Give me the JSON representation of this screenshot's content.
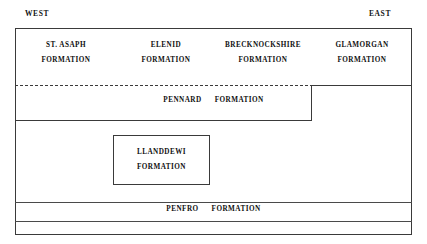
{
  "orientation": {
    "west_label": "WEST",
    "east_label": "EAST"
  },
  "chart_data": {
    "type": "diagram",
    "title": "",
    "subtype": "stratigraphic-correlation-chart",
    "axis_labels": {
      "left": "WEST",
      "right": "EAST"
    },
    "units": [
      {
        "name": "ST. ASAPH",
        "qualifier": "FORMATION",
        "row": "upper",
        "column": 1,
        "extent_west": 0.0,
        "extent_east": 0.25
      },
      {
        "name": "ELENID",
        "qualifier": "FORMATION",
        "row": "upper",
        "column": 2,
        "extent_west": 0.25,
        "extent_east": 0.5
      },
      {
        "name": "BRECKNOCKSHIRE",
        "qualifier": "FORMATION",
        "row": "upper",
        "column": 3,
        "extent_west": 0.5,
        "extent_east": 0.75
      },
      {
        "name": "GLAMORGAN",
        "qualifier": "FORMATION",
        "row": "upper",
        "column": 4,
        "extent_west": 0.75,
        "extent_east": 1.0
      },
      {
        "name": "PENNARD",
        "qualifier": "FORMATION",
        "row": "middle",
        "extent_west": 0.0,
        "extent_east": 0.75
      },
      {
        "name": "LLANDDEWI",
        "qualifier": "FORMATION",
        "row": "lower-inset",
        "extent_west": 0.25,
        "extent_east": 0.49
      },
      {
        "name": "PENFRO",
        "qualifier": "FORMATION",
        "row": "basal",
        "extent_west": 0.0,
        "extent_east": 1.0
      }
    ],
    "boundaries": [
      {
        "name": "pennard-upper-boundary-west",
        "style": "dashed",
        "extent_west": 0.0,
        "extent_east": 0.75
      },
      {
        "name": "pennard-upper-boundary-east",
        "style": "solid",
        "extent_west": 0.75,
        "extent_east": 1.0
      },
      {
        "name": "pennard-base",
        "style": "solid",
        "extent_west": 0.0,
        "extent_east": 0.75
      },
      {
        "name": "penfro-top",
        "style": "solid",
        "extent_west": 0.0,
        "extent_east": 1.0
      },
      {
        "name": "penfro-base",
        "style": "solid",
        "extent_west": 0.0,
        "extent_east": 1.0
      }
    ],
    "colors": {
      "line": "#3a3a3a",
      "text": "#111111",
      "background": "#ffffff"
    }
  },
  "units_text": {
    "st_asaph": {
      "name": "ST. ASAPH",
      "formation": "FORMATION"
    },
    "elenid": {
      "name": "ELENID",
      "formation": "FORMATION"
    },
    "brecknockshire": {
      "name": "BRECKNOCKSHIRE",
      "formation": "FORMATION"
    },
    "glamorgan": {
      "name": "GLAMORGAN",
      "formation": "FORMATION"
    },
    "pennard": {
      "name": "PENNARD",
      "formation": "FORMATION"
    },
    "llanddewi": {
      "name": "LLANDDEWI",
      "formation": "FORMATION"
    },
    "penfro": {
      "name": "PENFRO",
      "formation": "FORMATION"
    }
  }
}
